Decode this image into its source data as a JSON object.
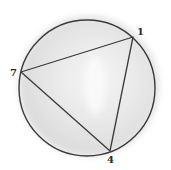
{
  "diagram": {
    "type": "circle-inscribed-triangle",
    "colors": {
      "background": "#ffffff",
      "shading": "#d6d6d6",
      "stroke": "#3a3a3a",
      "label": "#2a2a2a"
    },
    "circle": {
      "cx": 87,
      "cy": 88,
      "r": 68
    },
    "points": [
      {
        "label": "1",
        "x": 133,
        "y": 37,
        "lx": 137,
        "ly": 35
      },
      {
        "label": "7",
        "x": 21,
        "y": 72,
        "lx": 10,
        "ly": 76
      },
      {
        "label": "4",
        "x": 110,
        "y": 151,
        "lx": 107,
        "ly": 163
      }
    ]
  }
}
